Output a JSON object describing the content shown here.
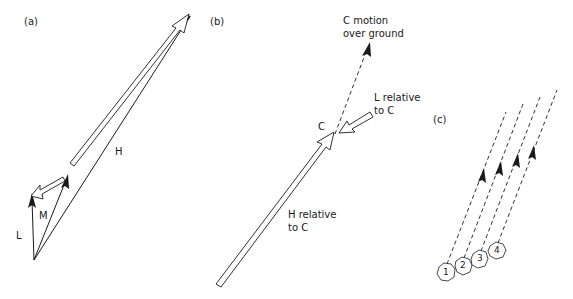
{
  "panels": {
    "a": {
      "label": "(a)",
      "vectors": {
        "L": "L",
        "M": "M",
        "H": "H"
      }
    },
    "b": {
      "label": "(b)",
      "c_motion": [
        "C motion",
        "over ground"
      ],
      "l_relative": [
        "L relative",
        "to C"
      ],
      "h_relative": [
        "H relative",
        "to C"
      ],
      "point_c": "C"
    },
    "c": {
      "label": "(c)",
      "stones": [
        "1",
        "2",
        "3",
        "4"
      ]
    }
  },
  "colors": {
    "line": "#1a1a1a",
    "background": "#ffffff"
  }
}
